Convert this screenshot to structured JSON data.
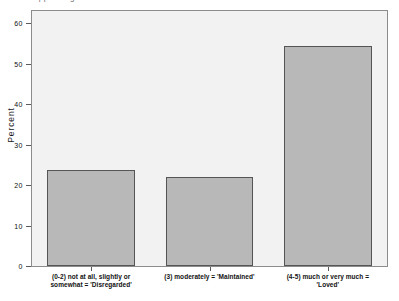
{
  "figure": {
    "truncated_title": "appraising",
    "background_color": "#ffffff",
    "plot_background_color": "#f2f2f2",
    "bar_color": "#b8b8b8",
    "bar_edge_color": "#555555",
    "frame_color": "#8c8c8c"
  },
  "chart_data": {
    "type": "bar",
    "title": "",
    "xlabel": "",
    "ylabel": "Percent",
    "categories": [
      "(0-2) not at all, slightly or somewhat = 'Disregarded'",
      "(3) moderately = 'Maintained'",
      "(4-5) much or very much = 'Loved'"
    ],
    "category_lines": [
      [
        "(0-2) not at all, slightly or",
        "somewhat = 'Disregarded'"
      ],
      [
        "(3) moderately = 'Maintained'"
      ],
      [
        "(4-5) much or very much =",
        "'Loved'"
      ]
    ],
    "values": [
      23.6,
      21.9,
      54.4
    ],
    "ylim": [
      0,
      63
    ],
    "yticks": [
      0,
      10,
      20,
      30,
      40,
      50,
      60
    ],
    "ytick_labels": [
      "0",
      "10",
      "20",
      "30",
      "40",
      "50",
      "60"
    ],
    "grid": false,
    "legend": null
  }
}
